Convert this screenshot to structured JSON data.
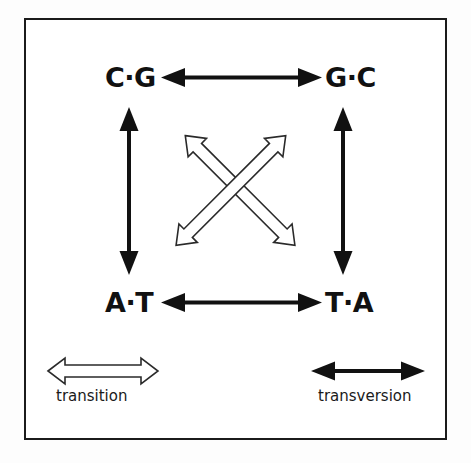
{
  "figure": {
    "type": "diagram",
    "frame_color": "#1b1b1b",
    "background_color": "#ffffff",
    "ink_color": "#111111"
  },
  "nodes": [
    {
      "id": "cg",
      "label": "C·G",
      "position": "top-left"
    },
    {
      "id": "gc",
      "label": "G·C",
      "position": "top-right"
    },
    {
      "id": "at",
      "label": "A·T",
      "position": "bottom-left"
    },
    {
      "id": "ta",
      "label": "T·A",
      "position": "bottom-right"
    }
  ],
  "edges": [
    {
      "id": "cg-gc",
      "from": "cg",
      "to": "gc",
      "style": "solid",
      "kind": "transversion",
      "orientation": "horizontal"
    },
    {
      "id": "at-ta",
      "from": "at",
      "to": "ta",
      "style": "solid",
      "kind": "transversion",
      "orientation": "horizontal"
    },
    {
      "id": "cg-at",
      "from": "cg",
      "to": "at",
      "style": "solid",
      "kind": "transversion",
      "orientation": "vertical"
    },
    {
      "id": "gc-ta",
      "from": "gc",
      "to": "ta",
      "style": "solid",
      "kind": "transversion",
      "orientation": "vertical"
    },
    {
      "id": "cg-ta",
      "from": "cg",
      "to": "ta",
      "style": "hollow",
      "kind": "transition",
      "orientation": "diagonal"
    },
    {
      "id": "gc-at",
      "from": "gc",
      "to": "at",
      "style": "hollow",
      "kind": "transition",
      "orientation": "diagonal"
    }
  ],
  "legend": {
    "items": [
      {
        "id": "transition",
        "label": "transition",
        "style": "hollow"
      },
      {
        "id": "transversion",
        "label": "transversion",
        "style": "solid"
      }
    ]
  }
}
